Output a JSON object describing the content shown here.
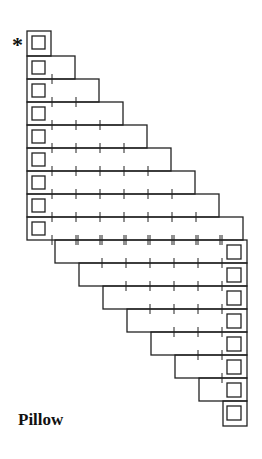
{
  "diagram": {
    "title": "Pillow",
    "start_marker": "*",
    "line_color": "#222222",
    "cell_width": 24,
    "row_height": 23,
    "left_rows": [
      {
        "index": 1,
        "cells": 1,
        "marked": true
      },
      {
        "index": 2,
        "cells": 2
      },
      {
        "index": 3,
        "cells": 3
      },
      {
        "index": 4,
        "cells": 4
      },
      {
        "index": 5,
        "cells": 5
      },
      {
        "index": 6,
        "cells": 6
      },
      {
        "index": 7,
        "cells": 7
      },
      {
        "index": 8,
        "cells": 8
      },
      {
        "index": 9,
        "cells": 9
      }
    ],
    "right_rows": [
      {
        "index": 10,
        "cells": 8
      },
      {
        "index": 11,
        "cells": 7
      },
      {
        "index": 12,
        "cells": 6
      },
      {
        "index": 13,
        "cells": 5
      },
      {
        "index": 14,
        "cells": 4
      },
      {
        "index": 15,
        "cells": 3
      },
      {
        "index": 16,
        "cells": 2
      },
      {
        "index": 17,
        "cells": 1
      }
    ]
  }
}
